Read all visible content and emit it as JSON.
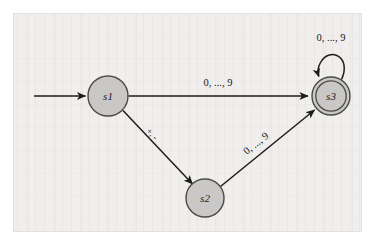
{
  "diagram": {
    "type": "finite-state-machine",
    "title": "",
    "states": [
      {
        "id": "s1",
        "label": "s1",
        "accepting": false,
        "start": true,
        "cx": 108,
        "cy": 96,
        "r": 20
      },
      {
        "id": "s2",
        "label": "s2",
        "accepting": false,
        "start": false,
        "cx": 205,
        "cy": 198,
        "r": 19
      },
      {
        "id": "s3",
        "label": "s3",
        "accepting": true,
        "start": false,
        "cx": 331,
        "cy": 96,
        "r": 19
      }
    ],
    "transitions": [
      {
        "from": "start",
        "to": "s1",
        "label": ""
      },
      {
        "from": "s1",
        "to": "s3",
        "label": "0, ..., 9"
      },
      {
        "from": "s1",
        "to": "s2",
        "label": "+, -"
      },
      {
        "from": "s2",
        "to": "s3",
        "label": "0, ..., 9"
      },
      {
        "from": "s3",
        "to": "s3",
        "label": "0, ..., 9"
      }
    ],
    "colors": {
      "node_fill": "#cac8c6",
      "node_stroke": "#4a4a4a",
      "edge_stroke": "#1c1c1c",
      "background": "#f0efed",
      "frame_stroke": "#e2e1de",
      "text": "#15151a"
    }
  },
  "labels": {
    "s1": "s1",
    "s2": "s2",
    "s3": "s3",
    "edge_s1_s3": "0, ..., 9",
    "edge_s1_s2": "+, -",
    "edge_s2_s3": "0, ..., 9",
    "edge_s3_loop": "0, ..., 9"
  }
}
